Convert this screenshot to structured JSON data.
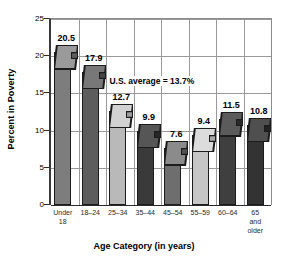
{
  "chart_data": {
    "type": "bar",
    "title": "",
    "xlabel": "Age Category (in years)",
    "ylabel": "Percent in Poverty",
    "categories": [
      "Under\n18",
      "18–24",
      "25–34",
      "35–44",
      "45–54",
      "55–59",
      "60–64",
      "65\nand\nolder"
    ],
    "values": [
      20.5,
      17.9,
      12.7,
      9.9,
      7.6,
      9.4,
      11.5,
      10.8
    ],
    "value_labels": [
      "20.5",
      "17.9",
      "12.7",
      "9.9",
      "7.6",
      "9.4",
      "11.5",
      "10.8"
    ],
    "ylim": [
      0,
      25
    ],
    "yticks": [
      0,
      5,
      10,
      15,
      20,
      25
    ],
    "ytick_labels": [
      "0",
      "5",
      "10",
      "15",
      "20",
      "25"
    ],
    "grid": true,
    "legend": "none",
    "annotations": [
      {
        "text": "U.S. average = 13.7%",
        "value": 13.7
      }
    ],
    "bar_colors": [
      "#7d7d7d",
      "#5d5d5d",
      "#b9b9b9",
      "#3a3a3a",
      "#6e6e6e",
      "#c6c6c6",
      "#3f3f3f",
      "#333333"
    ],
    "bar_top_colors": [
      "#9a9a9a",
      "#787878",
      "#d2d2d2",
      "#565656",
      "#8b8b8b",
      "#dcdcdc",
      "#5b5b5b",
      "#4f4f4f"
    ],
    "bar_side_colors": [
      "#5e5e5e",
      "#454545",
      "#9a9a9a",
      "#272727",
      "#525252",
      "#a8a8a8",
      "#2b2b2b",
      "#232323"
    ]
  }
}
